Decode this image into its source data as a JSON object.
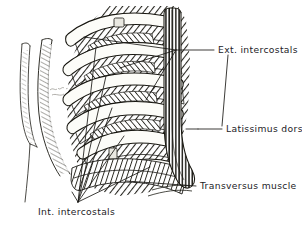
{
  "figure": {
    "kind": "anatomical-line-drawing",
    "background_color": "#ffffff",
    "ink_color": "#1c1b19",
    "rib_color": "#fdfdfb",
    "muscle_tone_color": "#6e6a63",
    "width": 302,
    "height": 228
  },
  "labels": {
    "ext_intercostals": "Ext. intercostals",
    "latissimus_dorsi": "Latissimus dorsi",
    "transversus_muscle": "Transversus muscle",
    "int_intercostals": "Int. intercostals"
  }
}
